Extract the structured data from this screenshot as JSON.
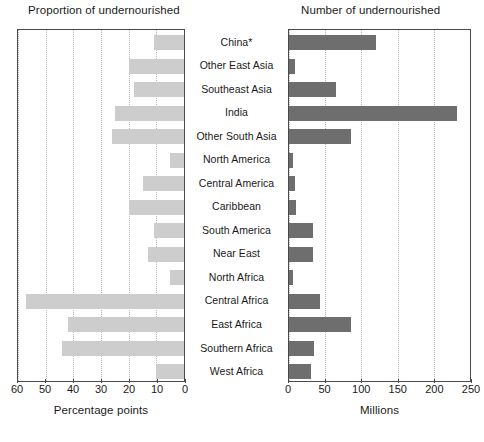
{
  "chart_data": {
    "type": "bar",
    "orientation": "horizontal",
    "layout": "two-panel back-to-back (butterfly) chart with shared category axis in the center",
    "grid": true,
    "legend": null,
    "categories": [
      "China*",
      "Other East Asia",
      "Southeast Asia",
      "India",
      "Other South Asia",
      "North America",
      "Central America",
      "Caribbean",
      "South America",
      "Near East",
      "North Africa",
      "Central Africa",
      "East Africa",
      "Southern Africa",
      "West Africa"
    ],
    "panels": [
      {
        "id": "left",
        "title": "Proportion of undernourished",
        "xlabel": "Percentage points",
        "xlim": [
          60,
          0
        ],
        "reversed": true,
        "ticks": [
          60,
          50,
          40,
          30,
          20,
          10,
          0
        ],
        "bar_color": "#cdcdcd",
        "values": [
          11,
          20,
          18,
          25,
          26,
          5,
          15,
          20,
          11,
          13,
          5,
          57,
          42,
          44,
          10
        ]
      },
      {
        "id": "right",
        "title": "Number of undernourished",
        "xlabel": "Millions",
        "xlim": [
          0,
          250
        ],
        "reversed": false,
        "ticks": [
          0,
          50,
          100,
          150,
          200,
          250
        ],
        "bar_color": "#6e6e6e",
        "values": [
          120,
          8,
          65,
          232,
          85,
          5,
          8,
          10,
          33,
          33,
          5,
          43,
          85,
          35,
          31
        ]
      }
    ]
  }
}
